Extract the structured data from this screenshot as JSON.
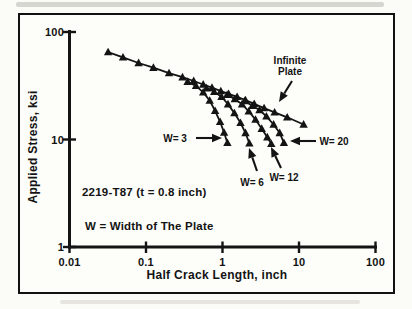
{
  "figure": {
    "background": "#fbfbf8",
    "frame_color": "#111111",
    "ink_color": "#141414"
  },
  "chart_data": {
    "type": "line",
    "title": "",
    "xlabel": "Half Crack Length, inch",
    "ylabel": "Applied Stress, ksi",
    "x_scale": "log",
    "y_scale": "log",
    "xlim": [
      0.01,
      100
    ],
    "ylim": [
      1,
      100
    ],
    "x_ticks": {
      "values": [
        0.01,
        0.1,
        1,
        10,
        100
      ],
      "labels": [
        "0.01",
        "0.1",
        "1",
        "10",
        "100"
      ]
    },
    "y_ticks": {
      "values": [
        1,
        10,
        100
      ],
      "labels": [
        "1",
        "10",
        "100"
      ]
    },
    "grid": false,
    "legend_position": "none (inline arrow annotations)",
    "marker": "filled-up-triangle",
    "series": [
      {
        "name": "Infinite Plate",
        "points": [
          [
            0.032,
            65
          ],
          [
            0.05,
            58
          ],
          [
            0.08,
            51.5
          ],
          [
            0.125,
            46.5
          ],
          [
            0.2,
            41.5
          ],
          [
            0.3,
            38
          ],
          [
            0.42,
            35
          ],
          [
            0.56,
            32.5
          ],
          [
            0.73,
            30.3
          ],
          [
            0.95,
            28.2
          ],
          [
            1.2,
            26.6
          ],
          [
            1.55,
            24.9
          ],
          [
            2.0,
            23.2
          ],
          [
            2.6,
            21.5
          ],
          [
            3.5,
            19.6
          ],
          [
            4.8,
            17.9
          ],
          [
            7.0,
            16.1
          ],
          [
            11.5,
            13.8
          ]
        ]
      },
      {
        "name": "W= 3",
        "points": [
          [
            0.35,
            34.5
          ],
          [
            0.45,
            31.5
          ],
          [
            0.56,
            27.5
          ],
          [
            0.68,
            23
          ],
          [
            0.8,
            18.5
          ],
          [
            0.93,
            14.6
          ],
          [
            1.05,
            11.6
          ],
          [
            1.16,
            9.3
          ]
        ]
      },
      {
        "name": "W= 6",
        "points": [
          [
            0.62,
            30
          ],
          [
            0.78,
            27.8
          ],
          [
            0.97,
            25
          ],
          [
            1.18,
            21.3
          ],
          [
            1.43,
            17.6
          ],
          [
            1.72,
            14.3
          ],
          [
            2.0,
            11.5
          ],
          [
            2.25,
            9.2
          ]
        ]
      },
      {
        "name": "W= 12",
        "points": [
          [
            1.15,
            26
          ],
          [
            1.45,
            23.8
          ],
          [
            1.8,
            21.3
          ],
          [
            2.2,
            18.3
          ],
          [
            2.7,
            15.3
          ],
          [
            3.25,
            12.6
          ],
          [
            3.85,
            10.5
          ],
          [
            4.35,
            9.1
          ]
        ]
      },
      {
        "name": "W= 20",
        "points": [
          [
            1.95,
            22.8
          ],
          [
            2.45,
            20.6
          ],
          [
            3.05,
            18.8
          ],
          [
            3.75,
            16.4
          ],
          [
            4.65,
            13.8
          ],
          [
            5.6,
            11.5
          ],
          [
            6.35,
            9.3
          ]
        ]
      }
    ],
    "annotations": [
      {
        "id": "infinite-plate",
        "lines": [
          "Infinite",
          "Plate"
        ],
        "align": "center",
        "pos": [
          290,
          66
        ],
        "arrow": {
          "from": [
            292,
            81
          ],
          "to": [
            279,
            102
          ]
        }
      },
      {
        "id": "w3",
        "lines": [
          "W= 3"
        ],
        "align": "center",
        "pos": [
          175,
          138
        ],
        "arrow": {
          "from": [
            196,
            138
          ],
          "to": [
            222,
            138
          ]
        }
      },
      {
        "id": "w20",
        "lines": [
          "W= 20"
        ],
        "align": "center",
        "pos": [
          334,
          141
        ],
        "arrow": {
          "from": [
            316,
            141
          ],
          "to": [
            290,
            141
          ]
        }
      },
      {
        "id": "w6",
        "lines": [
          "W= 6"
        ],
        "align": "center",
        "pos": [
          252,
          182
        ],
        "arrow": {
          "from": [
            257,
            171
          ],
          "to": [
            249,
            148
          ]
        }
      },
      {
        "id": "w12",
        "lines": [
          "W= 12"
        ],
        "align": "center",
        "pos": [
          284,
          177
        ],
        "arrow": {
          "from": [
            281,
            168
          ],
          "to": [
            271,
            147
          ]
        }
      },
      {
        "id": "material-note",
        "lines": [
          "2219-T87 (t = 0.8 inch)"
        ],
        "align": "left",
        "pos": [
          82,
          192
        ]
      },
      {
        "id": "width-note",
        "lines": [
          "W = Width of The Plate"
        ],
        "align": "left",
        "pos": [
          85,
          226
        ]
      }
    ]
  }
}
